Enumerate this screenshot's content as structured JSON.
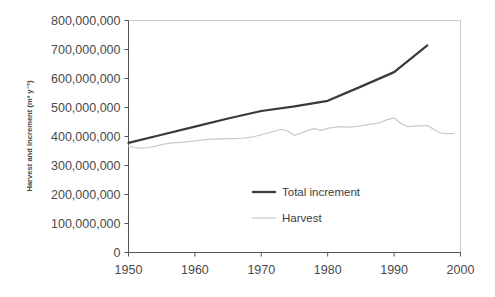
{
  "chart_data": {
    "type": "line",
    "title": "",
    "xlabel": "",
    "ylabel": "Harvest and increment (m³ y⁻¹)",
    "xlim": [
      1950,
      2000
    ],
    "ylim": [
      0,
      800000000
    ],
    "xticks": [
      1950,
      1960,
      1970,
      1980,
      1990,
      2000
    ],
    "xtick_labels": [
      "1950",
      "1960",
      "1970",
      "1980",
      "1990",
      "2000"
    ],
    "yticks": [
      0,
      100000000,
      200000000,
      300000000,
      400000000,
      500000000,
      600000000,
      700000000,
      800000000
    ],
    "ytick_labels": [
      "0",
      "100,000,000",
      "200,000,000",
      "300,000,000",
      "400,000,000",
      "500,000,000",
      "600,000,000",
      "700,000,000",
      "800,000,000"
    ],
    "grid": false,
    "legend_position": "inside-center-bottom",
    "series": [
      {
        "name": "Total increment",
        "color": "#3a3a3a",
        "line_width": 2.2,
        "x": [
          1950,
          1955,
          1960,
          1965,
          1970,
          1975,
          1980,
          1985,
          1990,
          1995
        ],
        "values": [
          378000000,
          406000000,
          434000000,
          462000000,
          488000000,
          504000000,
          523000000,
          572000000,
          622000000,
          714000000
        ]
      },
      {
        "name": "Harvest",
        "color": "#c9c9c9",
        "line_width": 1.2,
        "x": [
          1950,
          1951,
          1952,
          1953,
          1954,
          1955,
          1956,
          1957,
          1958,
          1959,
          1960,
          1961,
          1962,
          1963,
          1964,
          1965,
          1966,
          1967,
          1968,
          1969,
          1970,
          1971,
          1972,
          1973,
          1974,
          1975,
          1976,
          1977,
          1978,
          1979,
          1980,
          1981,
          1982,
          1983,
          1984,
          1985,
          1986,
          1987,
          1988,
          1989,
          1990,
          1991,
          1992,
          1993,
          1994,
          1995,
          1996,
          1997,
          1998,
          1999
        ],
        "values": [
          367000000,
          362000000,
          360000000,
          362000000,
          366000000,
          372000000,
          376000000,
          379000000,
          380000000,
          382000000,
          385000000,
          388000000,
          390000000,
          391000000,
          392000000,
          393000000,
          393000000,
          394000000,
          396000000,
          400000000,
          406000000,
          412000000,
          418000000,
          425000000,
          418000000,
          404000000,
          412000000,
          421000000,
          427000000,
          421000000,
          428000000,
          432000000,
          434000000,
          432000000,
          434000000,
          437000000,
          441000000,
          444000000,
          449000000,
          458000000,
          464000000,
          446000000,
          434000000,
          436000000,
          437000000,
          438000000,
          424000000,
          412000000,
          410000000,
          410000000
        ]
      }
    ]
  },
  "legend": {
    "entries": [
      {
        "label": "Total increment"
      },
      {
        "label": "Harvest"
      }
    ]
  }
}
